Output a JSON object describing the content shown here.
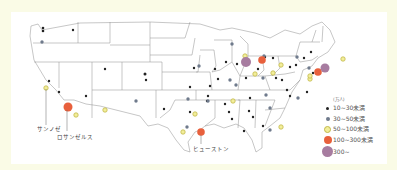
{
  "map": {
    "type": "dot-map",
    "region": "United States (contiguous)",
    "colors": {
      "background": "#fafbe6",
      "panel": "#ffffff",
      "border_lines": "#8a8a8a",
      "size_10_30": "#222222",
      "size_30_50": "#6f7a8c",
      "size_50_100": "#e6e07a",
      "size_100_300": "#e8603c",
      "size_300_plus": "#a77ca0"
    },
    "city_labels": [
      {
        "name": "サンノゼ"
      },
      {
        "name": "ロサンゼルス"
      },
      {
        "name": "ヒューストン"
      }
    ]
  },
  "legend": {
    "unit": "(万人)",
    "items": [
      {
        "label": "10~30未満",
        "category": "size_10_30"
      },
      {
        "label": "30~50未満",
        "category": "size_30_50"
      },
      {
        "label": "50~100未満",
        "category": "size_50_100"
      },
      {
        "label": "100~300未満",
        "category": "size_100_300"
      },
      {
        "label": "300~",
        "category": "size_300_plus"
      }
    ]
  }
}
